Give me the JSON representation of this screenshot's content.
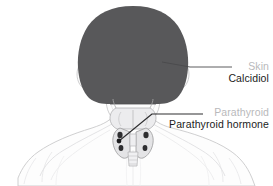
{
  "figure": {
    "colors": {
      "background": "#ffffff",
      "hair": "#58585a",
      "skin_fill": "#fdfdfd",
      "outline": "#c9c9cb",
      "gland_fill": "#e4e4e6",
      "gland_outline": "#9a9a9c",
      "parathyroid_dot": "#2e2e30",
      "organ_label": "#b9b9bb",
      "hormone_label": "#1c1c1c",
      "leader_line": "#4a4a4c"
    }
  },
  "callouts": [
    {
      "id": "skin",
      "organ": "Skin",
      "hormone": "Calcidiol",
      "leader": {
        "anchor_x": 162,
        "anchor_y": 62,
        "bend_x": 190,
        "bend_y": 67,
        "end_x": 232,
        "end_y": 67
      }
    },
    {
      "id": "parathyroid",
      "organ": "Parathyroid",
      "hormone": "Parathyroid hormone",
      "leader": {
        "anchor_x": 119,
        "anchor_y": 141,
        "bend_x": 152,
        "bend_y": 114,
        "end_x": 203,
        "end_y": 114
      }
    }
  ]
}
